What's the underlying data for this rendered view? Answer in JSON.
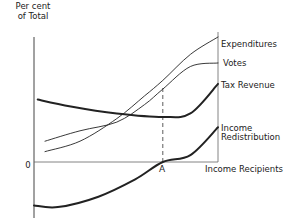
{
  "chart_data": {
    "type": "line",
    "title": "",
    "ylabel": [
      "Per cent",
      "of Total"
    ],
    "xlabel": "Income Recipients",
    "origin_label": "0",
    "marker": {
      "label": "A",
      "x": 0.7
    },
    "xlim": [
      0,
      1
    ],
    "ylim": [
      -0.3,
      0.75
    ],
    "series": [
      {
        "name": "Expenditures",
        "weight": "thin",
        "points": [
          [
            0.06,
            0.06
          ],
          [
            0.25,
            0.12
          ],
          [
            0.45,
            0.25
          ],
          [
            0.6,
            0.38
          ],
          [
            0.7,
            0.47
          ],
          [
            0.85,
            0.62
          ],
          [
            1.0,
            0.72
          ]
        ]
      },
      {
        "name": "Votes",
        "weight": "thin",
        "points": [
          [
            0.06,
            0.12
          ],
          [
            0.25,
            0.18
          ],
          [
            0.45,
            0.23
          ],
          [
            0.6,
            0.33
          ],
          [
            0.7,
            0.42
          ],
          [
            0.85,
            0.55
          ],
          [
            1.0,
            0.57
          ]
        ]
      },
      {
        "name": "Tax Revenue",
        "weight": "thick",
        "points": [
          [
            0.02,
            0.36
          ],
          [
            0.2,
            0.32
          ],
          [
            0.45,
            0.28
          ],
          [
            0.7,
            0.26
          ],
          [
            0.85,
            0.28
          ],
          [
            1.0,
            0.45
          ]
        ]
      },
      {
        "name": "Income Redistribution",
        "label_lines": [
          "Income",
          "Redistribution"
        ],
        "weight": "thick",
        "points": [
          [
            0.0,
            -0.25
          ],
          [
            0.13,
            -0.26
          ],
          [
            0.35,
            -0.2
          ],
          [
            0.55,
            -0.1
          ],
          [
            0.7,
            0.0
          ],
          [
            0.85,
            0.04
          ],
          [
            1.0,
            0.2
          ]
        ]
      }
    ],
    "grid": false,
    "legend": "direct labels at right"
  }
}
